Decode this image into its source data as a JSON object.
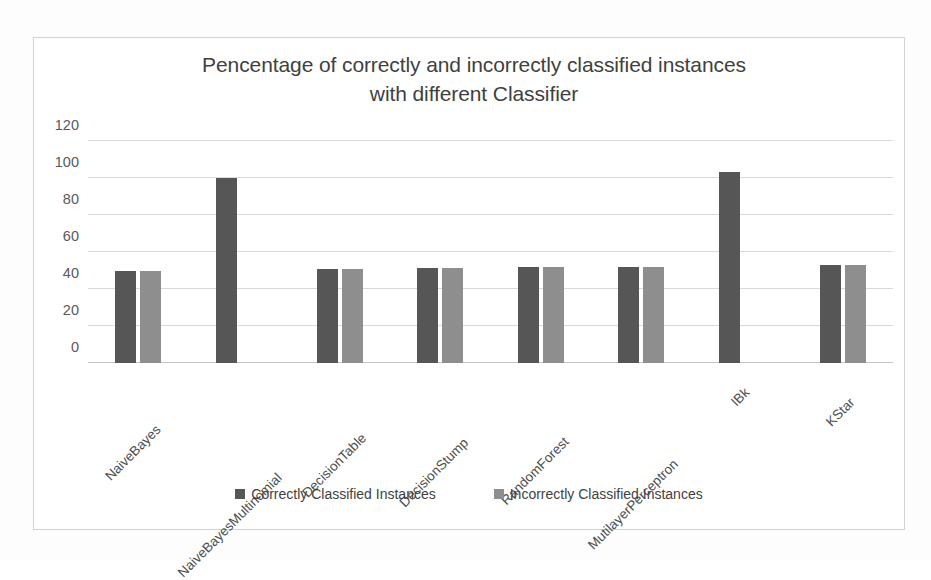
{
  "chart_data": {
    "type": "bar",
    "title": "Pencentage of correctly and incorrectly classified instances with different Classifier",
    "title_line1": "Pencentage of correctly and incorrectly classified instances",
    "title_line2": "with different Classifier",
    "xlabel": "",
    "ylabel": "",
    "ylim": [
      0,
      120
    ],
    "yticks": [
      0,
      20,
      40,
      60,
      80,
      100,
      120
    ],
    "ytick_labels": [
      "0",
      "20",
      "40",
      "60",
      "80",
      "100",
      "120"
    ],
    "grid": true,
    "legend_position": "bottom",
    "categories": [
      "NaiveBayes",
      "NaiveBayesMultinomial",
      "DecisionTable",
      "DecisionStump",
      "RandomForest",
      "MutilayerPerceptron",
      "IBk",
      "KStar"
    ],
    "series": [
      {
        "name": "Correctly Classified Instances",
        "color": "#565656",
        "values": [
          50,
          100,
          51,
          51.5,
          52,
          52,
          103,
          53
        ]
      },
      {
        "name": "Incorrectly Classified Instances",
        "color": "#8e8e8e",
        "values": [
          50,
          0,
          51,
          51.5,
          52,
          52,
          0,
          53
        ]
      }
    ]
  },
  "legend": {
    "items": [
      {
        "label": "Correctly Classified Instances",
        "swatch": "correct"
      },
      {
        "label": "Incorrectly Classified Instances",
        "swatch": "incorrect"
      }
    ]
  },
  "colors": {
    "correct_bar": "#565656",
    "incorrect_bar": "#8e8e8e",
    "gridline": "#d9d9d9",
    "frame_border": "#d2d2d2",
    "title_text": "#3f3f3f",
    "tick_text": "#595959"
  }
}
